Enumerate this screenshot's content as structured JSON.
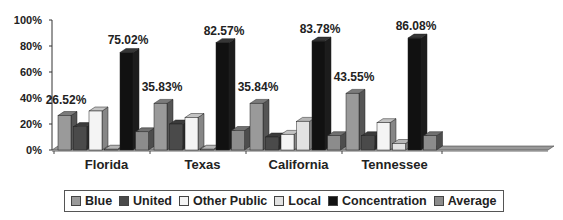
{
  "chart_data": {
    "type": "bar",
    "title": "",
    "xlabel": "",
    "ylabel": "",
    "ylim": [
      0,
      100
    ],
    "yticks": [
      "0%",
      "20%",
      "40%",
      "60%",
      "80%",
      "100%"
    ],
    "categories": [
      "Florida",
      "Texas",
      "California",
      "Tennessee"
    ],
    "series": [
      {
        "name": "Blue",
        "color": "#9a9a9a",
        "values": [
          26.52,
          35.83,
          35.84,
          43.55
        ]
      },
      {
        "name": "United",
        "color": "#4a4a4a",
        "values": [
          18,
          20,
          10,
          11
        ]
      },
      {
        "name": "Other Public",
        "color": "#f4f4f4",
        "values": [
          30,
          25,
          12,
          21
        ]
      },
      {
        "name": "Local",
        "color": "#e2e2e2",
        "values": [
          0,
          0,
          22,
          5
        ]
      },
      {
        "name": "Concentration",
        "color": "#111111",
        "values": [
          75.02,
          82.57,
          83.78,
          86.08
        ]
      },
      {
        "name": "Average",
        "color": "#8c8c8c",
        "values": [
          14,
          15,
          11,
          11
        ]
      }
    ],
    "data_labels": {
      "Blue": [
        "26.52%",
        "35.83%",
        "35.84%",
        "43.55%"
      ],
      "Concentration": [
        "75.02%",
        "82.57%",
        "83.78%",
        "86.08%"
      ]
    },
    "legend_position": "bottom",
    "grid": false,
    "style": "3d-column"
  },
  "legend": {
    "items": [
      {
        "label": "Blue",
        "color": "#9a9a9a"
      },
      {
        "label": "United",
        "color": "#4a4a4a"
      },
      {
        "label": "Other Public",
        "color": "#f4f4f4"
      },
      {
        "label": "Local",
        "color": "#e2e2e2"
      },
      {
        "label": "Concentration",
        "color": "#111111"
      },
      {
        "label": "Average",
        "color": "#8c8c8c"
      }
    ]
  }
}
